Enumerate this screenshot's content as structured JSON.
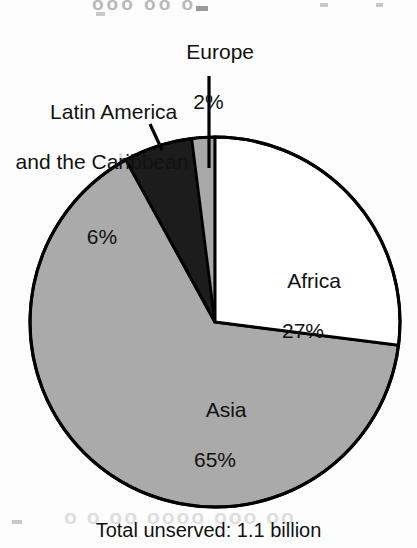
{
  "chart_data": {
    "type": "pie",
    "title": "",
    "subtitle": "",
    "categories": [
      "Africa",
      "Asia",
      "Latin America and the Caribbean",
      "Europe"
    ],
    "values": [
      27,
      65,
      6,
      2
    ],
    "value_labels": [
      "27%",
      "65%",
      "6%",
      "2%"
    ],
    "units": "percent",
    "start_angle_deg": 0,
    "direction": "clockwise",
    "legend_position": "none",
    "grid": false,
    "slice_colors": [
      "#ffffff",
      "#aaaaaa",
      "#1c1c1c",
      "#a8a8a8"
    ],
    "slice_label_placement": [
      "inside",
      "inside",
      "callout",
      "callout"
    ],
    "footnote": "Total unserved: 1.1 billion",
    "annotations": [
      {
        "name": "europe-callout",
        "text": "Europe\n2%"
      },
      {
        "name": "latin-america-callout",
        "text": "Latin America\nand the Caribbean\n6%"
      }
    ]
  },
  "chart": {
    "slices": [
      {
        "id": "africa",
        "name": "Africa",
        "percent_label": "27%",
        "value": 27,
        "color": "#ffffff"
      },
      {
        "id": "asia",
        "name": "Asia",
        "percent_label": "65%",
        "value": 65,
        "color": "#aaaaaa"
      },
      {
        "id": "latin",
        "name": "Latin America and the Caribbean",
        "name_line1": "Latin America",
        "name_line2": "and the Caribbean",
        "percent_label": "6%",
        "value": 6,
        "color": "#1c1c1c"
      },
      {
        "id": "europe",
        "name": "Europe",
        "percent_label": "2%",
        "value": 2,
        "color": "#a8a8a8"
      }
    ],
    "footnote": "Total unserved: 1.1 billion",
    "outline_color": "#000000"
  },
  "artifacts": {
    "top": "ooo    oo  o",
    "middle": "bleed",
    "bottom": "o o oo   oooo ooo  oo"
  }
}
